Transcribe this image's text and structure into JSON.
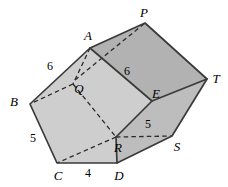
{
  "figure": {
    "type": "geometry-diagram",
    "colors": {
      "outline": "#3a3a3a",
      "hidden_edge": "#2e2e2e",
      "face_light": "#cfcfcf",
      "face_medium": "#c2c2c2",
      "face_dark": "#b0b0b0",
      "background": "#ffffff",
      "label": "#000000"
    },
    "vertex_labels": [
      {
        "id": "P",
        "text": "P",
        "x": 144,
        "y": 12
      },
      {
        "id": "A",
        "text": "A",
        "x": 88,
        "y": 35
      },
      {
        "id": "T",
        "text": "T",
        "x": 216,
        "y": 78
      },
      {
        "id": "E",
        "text": "E",
        "x": 156,
        "y": 93
      },
      {
        "id": "B",
        "text": "B",
        "x": 14,
        "y": 101
      },
      {
        "id": "Q",
        "text": "Q",
        "x": 79,
        "y": 88
      },
      {
        "id": "R",
        "text": "R",
        "x": 118,
        "y": 147
      },
      {
        "id": "S",
        "text": "S",
        "x": 177,
        "y": 146
      },
      {
        "id": "C",
        "text": "C",
        "x": 58,
        "y": 175
      },
      {
        "id": "D",
        "text": "D",
        "x": 119,
        "y": 175
      }
    ],
    "measure_labels": [
      {
        "id": "ba",
        "text": "6",
        "x": 50,
        "y": 66
      },
      {
        "id": "ae",
        "text": "6",
        "x": 127,
        "y": 71
      },
      {
        "id": "bc",
        "text": "5",
        "x": 33,
        "y": 138
      },
      {
        "id": "es",
        "text": "5",
        "x": 148,
        "y": 124
      },
      {
        "id": "cd",
        "text": "4",
        "x": 88,
        "y": 173
      }
    ],
    "vertices": {
      "P": [
        145,
        23
      ],
      "A": [
        90,
        48
      ],
      "T": [
        207,
        79
      ],
      "E": [
        152,
        101
      ],
      "B": [
        30,
        104
      ],
      "Q": [
        73,
        84
      ],
      "R": [
        116,
        137
      ],
      "S": [
        172,
        136
      ],
      "C": [
        57,
        163
      ],
      "D": [
        117,
        163
      ]
    },
    "faces": [
      {
        "id": "face-aptE",
        "points": "90,48 145,23 207,79 152,101",
        "shade": "#b2b2b2"
      },
      {
        "id": "face-abcdre",
        "points": "90,48 30,104 57,163 117,163 116,137 152,101",
        "shade": "#cecece"
      },
      {
        "id": "face-etsd",
        "points": "152,101 207,79 172,136 117,163 116,137",
        "shade": "#bdbdbd"
      }
    ],
    "solid_edges": [
      {
        "id": "edge-AP",
        "from": "A",
        "to": "P"
      },
      {
        "id": "edge-PT",
        "from": "P",
        "to": "T"
      },
      {
        "id": "edge-TS",
        "from": "T",
        "to": "S"
      },
      {
        "id": "edge-SD",
        "from": "S",
        "to": "D"
      },
      {
        "id": "edge-DC",
        "from": "D",
        "to": "C"
      },
      {
        "id": "edge-CB",
        "from": "C",
        "to": "B"
      },
      {
        "id": "edge-BA",
        "from": "B",
        "to": "A"
      },
      {
        "id": "edge-AE",
        "from": "A",
        "to": "E"
      },
      {
        "id": "edge-ET",
        "from": "E",
        "to": "T"
      },
      {
        "id": "edge-ER",
        "from": "E",
        "to": "R"
      },
      {
        "id": "edge-RD",
        "from": "R",
        "to": "D"
      }
    ],
    "dashed_edges": [
      {
        "id": "edge-AQ",
        "from": "A",
        "to": "Q"
      },
      {
        "id": "edge-QB",
        "from": "Q",
        "to": "B"
      },
      {
        "id": "edge-QR",
        "from": "Q",
        "to": "R"
      },
      {
        "id": "edge-RC",
        "from": "R",
        "to": "C"
      },
      {
        "id": "edge-RS",
        "from": "R",
        "to": "S"
      },
      {
        "id": "edge-QP",
        "from": "Q",
        "to": "P"
      }
    ]
  }
}
